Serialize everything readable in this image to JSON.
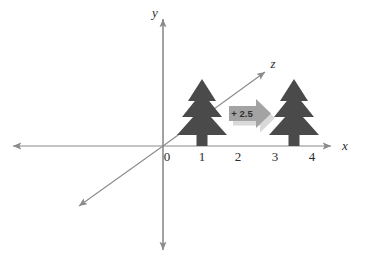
{
  "figure": {
    "background_color": "#ffffff",
    "axis_color": "#8a8a8a",
    "label_color": "#2b2b2b",
    "tree_color": "#4a4a4a",
    "arrow_fill_color": "#a3a3a3",
    "arrow_shadow_color": "#d9d9d9"
  },
  "axes": {
    "x": {
      "label": "x",
      "name": "x-axis"
    },
    "y": {
      "label": "y",
      "name": "y-axis"
    },
    "z": {
      "label": "z",
      "name": "z-axis"
    },
    "origin_label": "0",
    "x_ticks": [
      {
        "label": "0",
        "value": 0
      },
      {
        "label": "1",
        "value": 1
      },
      {
        "label": "2",
        "value": 2
      },
      {
        "label": "3",
        "value": 3
      },
      {
        "label": "4",
        "value": 4
      }
    ]
  },
  "objects": {
    "tree_original": {
      "name": "original-tree",
      "x_position": 1
    },
    "tree_translated": {
      "name": "translated-tree",
      "x_position": 3.5
    }
  },
  "annotation": {
    "shift_label": "+ 2.5",
    "name": "translation-arrow"
  }
}
